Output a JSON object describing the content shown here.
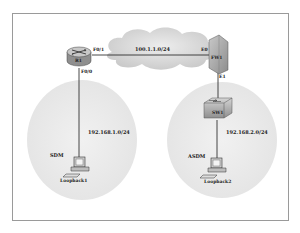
{
  "diagram": {
    "title": "",
    "devices": {
      "router": {
        "name": "R1",
        "if_wan": "F0/1",
        "if_lan": "F0/0"
      },
      "firewall": {
        "name": "FW1",
        "if_outside": "E0",
        "if_inside": "E1"
      },
      "switch": {
        "name": "SW1"
      },
      "pc_left": {
        "role": "SDM",
        "name": "Loopback1"
      },
      "pc_right": {
        "role": "ASDM",
        "name": "Loopback2"
      }
    },
    "networks": {
      "wan": "100.1.1.0/24",
      "lan_left": "192.168.1.0/24",
      "lan_right": "192.168.2.0/24"
    },
    "colors": {
      "border": "#9a9a9a",
      "ellipse": "#ececec",
      "cloud": "#d8d8d8",
      "line": "#1a1a1a",
      "device": "#b8b8b8"
    }
  }
}
